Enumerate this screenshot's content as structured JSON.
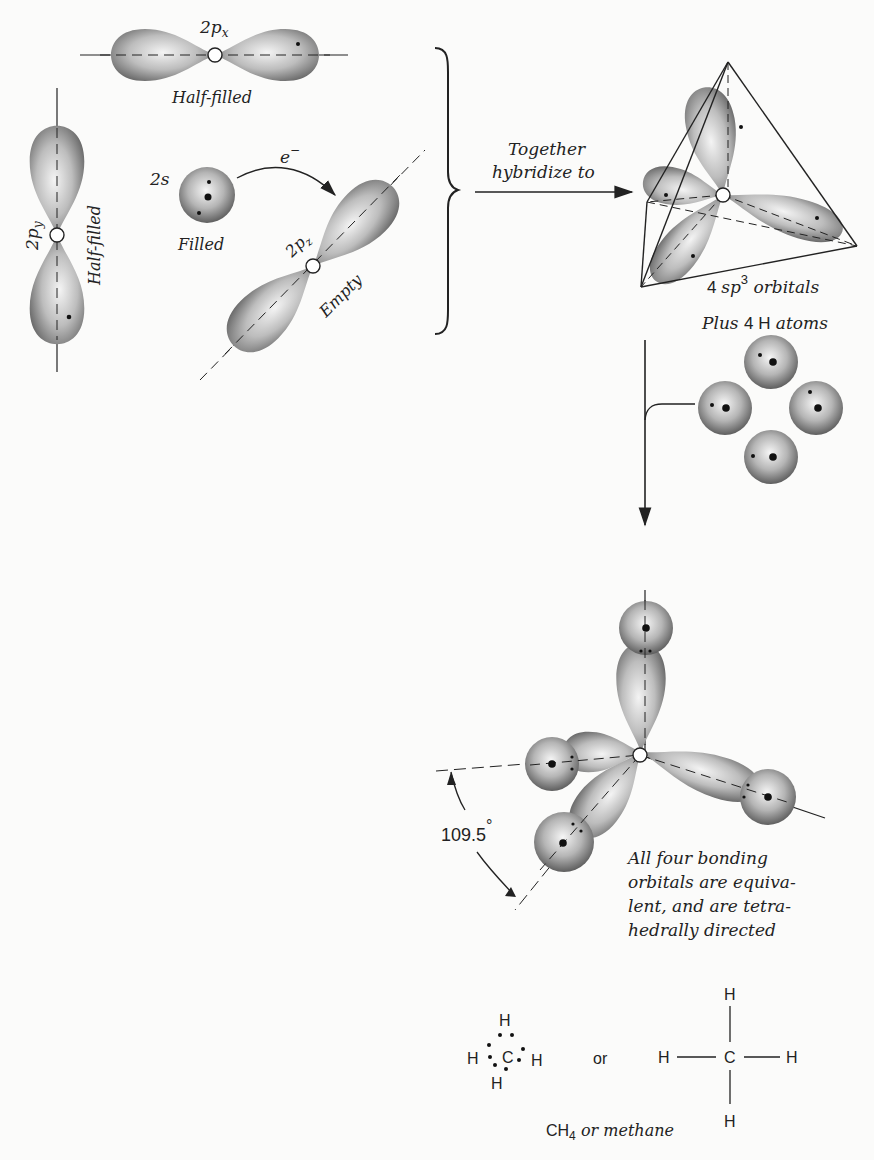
{
  "labels": {
    "px": "2p",
    "px_sub": "x",
    "px_state": "Half-filled",
    "py": "2p",
    "py_sub": "y",
    "py_state": "Half-filled",
    "s": "2s",
    "s_state": "Filled",
    "pz": "2p",
    "pz_sub": "z",
    "pz_state": "Empty",
    "electron": "e",
    "electron_sup": "−",
    "hybridize_line1": "Together",
    "hybridize_line2": "hybridize to",
    "sp3_prefix": "4 ",
    "sp3_sp": "sp",
    "sp3_sup": "3",
    "sp3_suffix": " orbitals",
    "plus_italic1": "Plus ",
    "plus_num": "4 H",
    "plus_italic2": " atoms",
    "angle": "109.5",
    "angle_unit": "°",
    "note_line1": "All four bonding",
    "note_line2": "orbitals are equiva-",
    "note_line3": "lent, and are tetra-",
    "note_line4": "hedrally directed",
    "or": "or",
    "ch4": "CH",
    "ch4_sub": "4",
    "methane": " or methane"
  },
  "lewis": {
    "h": "H",
    "c": "C"
  },
  "structural": {
    "h": "H",
    "c": "C"
  },
  "colors": {
    "lobe_dark": "#6e6e6e",
    "lobe_light": "#f2f2f2",
    "ink": "#222222"
  }
}
